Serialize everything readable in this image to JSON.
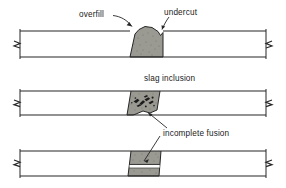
{
  "figure": {
    "background_color": "#ffffff",
    "line_color": "#262626",
    "weld_fill_color": "#9a9a92",
    "slag_color": "#1c1c1c",
    "plate_fill_color": "#ffffff"
  },
  "labels": {
    "overfill": "overfill",
    "undercut": "undercut",
    "slag_inclusion": "slag inclusion",
    "incomplete_fusion": "incomplete fusion"
  },
  "panels": [
    {
      "id": "panel-overfill-undercut",
      "index": 1,
      "defects": [
        "overfill",
        "undercut"
      ],
      "plate_top_y": 31,
      "plate_bottom_y": 57,
      "weld_center_x": 143
    },
    {
      "id": "panel-slag-inclusion",
      "index": 2,
      "defects": [
        "slag inclusion"
      ],
      "plate_top_y": 91,
      "plate_bottom_y": 115,
      "weld_center_x": 143
    },
    {
      "id": "panel-incomplete-fusion",
      "index": 3,
      "defects": [
        "incomplete fusion"
      ],
      "plate_top_y": 151,
      "plate_bottom_y": 176,
      "weld_center_x": 143
    }
  ]
}
